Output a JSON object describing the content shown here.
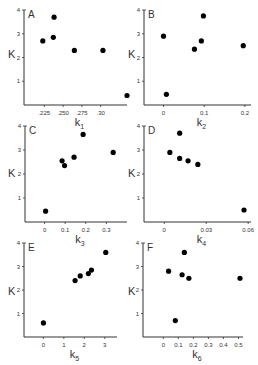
{
  "figure": {
    "ylabel": "K",
    "colors": {
      "axis": "#333333",
      "point": "#000000",
      "background": "#ffffff"
    }
  },
  "chart_data": [
    {
      "type": "scatter",
      "panel": "A",
      "xlabel": "k",
      "xlabel_sub": "1",
      "ylabel": "K",
      "xticks": [
        0.225,
        0.25,
        0.275,
        0.3
      ],
      "xtick_labels": [
        ".225",
        ".250",
        ".275",
        ".30"
      ],
      "yticks": [
        1,
        2,
        3,
        4
      ],
      "ytick_labels": [
        "1",
        "2",
        "3",
        "4"
      ],
      "xlim": [
        0.198,
        0.335
      ],
      "ylim": [
        0,
        4
      ],
      "grid": false,
      "points": [
        {
          "x": 0.223,
          "y": 2.7
        },
        {
          "x": 0.237,
          "y": 2.85
        },
        {
          "x": 0.238,
          "y": 3.7
        },
        {
          "x": 0.265,
          "y": 2.3
        },
        {
          "x": 0.303,
          "y": 2.3
        },
        {
          "x": 0.335,
          "y": 0.4
        }
      ]
    },
    {
      "type": "scatter",
      "panel": "B",
      "xlabel": "k",
      "xlabel_sub": "2",
      "ylabel": "K",
      "xticks": [
        0,
        0.1,
        0.2
      ],
      "xtick_labels": [
        "0",
        "0.1",
        "0.2"
      ],
      "yticks": [
        1,
        2,
        3,
        4
      ],
      "ytick_labels": [
        "1",
        "2",
        "3",
        "4"
      ],
      "xlim": [
        -0.048,
        0.215
      ],
      "ylim": [
        0,
        4
      ],
      "grid": false,
      "points": [
        {
          "x": 0.0,
          "y": 2.9
        },
        {
          "x": 0.007,
          "y": 0.45
        },
        {
          "x": 0.076,
          "y": 2.35
        },
        {
          "x": 0.093,
          "y": 2.7
        },
        {
          "x": 0.098,
          "y": 3.75
        },
        {
          "x": 0.196,
          "y": 2.5
        }
      ]
    },
    {
      "type": "scatter",
      "panel": "C",
      "xlabel": "k",
      "xlabel_sub": "3",
      "ylabel": "K",
      "xticks": [
        0,
        0.1,
        0.2,
        0.3
      ],
      "xtick_labels": [
        "0",
        "0.1",
        "0.2",
        "0.3"
      ],
      "yticks": [
        1,
        2,
        3,
        4
      ],
      "ytick_labels": [
        "1",
        "2",
        "3",
        "4"
      ],
      "xlim": [
        -0.095,
        0.4
      ],
      "ylim": [
        0,
        4
      ],
      "grid": false,
      "points": [
        {
          "x": 0.005,
          "y": 0.45
        },
        {
          "x": 0.085,
          "y": 2.55
        },
        {
          "x": 0.097,
          "y": 2.35
        },
        {
          "x": 0.143,
          "y": 2.7
        },
        {
          "x": 0.187,
          "y": 3.65
        },
        {
          "x": 0.333,
          "y": 2.9
        }
      ]
    },
    {
      "type": "scatter",
      "panel": "D",
      "xlabel": "k",
      "xlabel_sub": "4",
      "ylabel": "K",
      "xticks": [
        0,
        0.03,
        0.06
      ],
      "xtick_labels": [
        "0",
        "0.03",
        "0.06"
      ],
      "yticks": [
        1,
        2,
        3,
        4
      ],
      "ytick_labels": [
        "1",
        "2",
        "3",
        "4"
      ],
      "xlim": [
        -0.0145,
        0.062
      ],
      "ylim": [
        0,
        4
      ],
      "grid": false,
      "points": [
        {
          "x": 0.004,
          "y": 2.9
        },
        {
          "x": 0.011,
          "y": 3.7
        },
        {
          "x": 0.011,
          "y": 2.65
        },
        {
          "x": 0.017,
          "y": 2.55
        },
        {
          "x": 0.024,
          "y": 2.4
        },
        {
          "x": 0.057,
          "y": 0.5
        }
      ]
    },
    {
      "type": "scatter",
      "panel": "E",
      "xlabel": "k",
      "xlabel_sub": "5",
      "ylabel": "K",
      "xticks": [
        0,
        1,
        2,
        3
      ],
      "xtick_labels": [
        "0",
        "1",
        "2",
        "3"
      ],
      "yticks": [
        1,
        2,
        3,
        4
      ],
      "ytick_labels": [
        "1",
        "2",
        "3",
        "4"
      ],
      "xlim": [
        -0.95,
        3.6
      ],
      "ylim": [
        0,
        4
      ],
      "grid": false,
      "points": [
        {
          "x": 0.0,
          "y": 0.6
        },
        {
          "x": 1.55,
          "y": 2.4
        },
        {
          "x": 1.8,
          "y": 2.6
        },
        {
          "x": 2.2,
          "y": 2.7
        },
        {
          "x": 2.35,
          "y": 2.85
        },
        {
          "x": 3.05,
          "y": 3.6
        }
      ]
    },
    {
      "type": "scatter",
      "panel": "F",
      "xlabel": "k",
      "xlabel_sub": "6",
      "ylabel": "K",
      "xticks": [
        0,
        0.1,
        0.2,
        0.3,
        0.4,
        0.5
      ],
      "xtick_labels": [
        "0",
        "0.1",
        "0.2",
        "0.3",
        "0.4",
        "0.5"
      ],
      "yticks": [
        1,
        2,
        3,
        4
      ],
      "ytick_labels": [
        "1",
        "2",
        "3",
        "4"
      ],
      "xlim": [
        -0.135,
        0.53
      ],
      "ylim": [
        0,
        4
      ],
      "grid": false,
      "points": [
        {
          "x": 0.035,
          "y": 2.8
        },
        {
          "x": 0.08,
          "y": 0.7
        },
        {
          "x": 0.125,
          "y": 2.65
        },
        {
          "x": 0.14,
          "y": 3.6
        },
        {
          "x": 0.17,
          "y": 2.5
        },
        {
          "x": 0.51,
          "y": 2.5
        }
      ]
    }
  ]
}
